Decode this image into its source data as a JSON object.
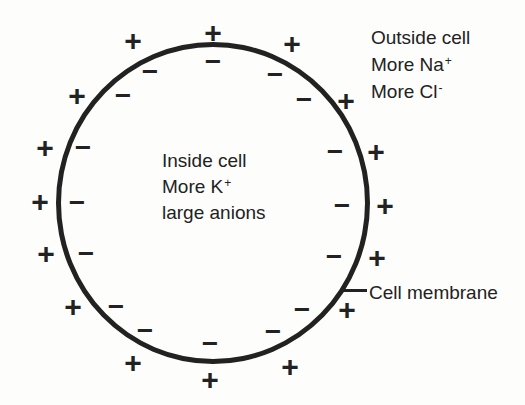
{
  "canvas": {
    "width": 525,
    "height": 405,
    "background": "#fdfdfc",
    "ink": "#222222"
  },
  "labels": {
    "outside": {
      "line1": "Outside cell",
      "line2_base": "More Na",
      "line2_sup": "+",
      "line3_base": "More Cl",
      "line3_sup": "-"
    },
    "inside": {
      "line1": "Inside cell",
      "line2_base": "More K",
      "line2_sup": "+",
      "line3": "large anions"
    },
    "membrane": "Cell membrane"
  },
  "charges": {
    "plus_glyph": "+",
    "minus_glyph": "−",
    "outside_plus_positions": [
      [
        213,
        33
      ],
      [
        292,
        44
      ],
      [
        346,
        101
      ],
      [
        376,
        152
      ],
      [
        385,
        206
      ],
      [
        377,
        258
      ],
      [
        347,
        310
      ],
      [
        290,
        367
      ],
      [
        210,
        380
      ],
      [
        133,
        363
      ],
      [
        73,
        307
      ],
      [
        46,
        254
      ],
      [
        40,
        202
      ],
      [
        45,
        148
      ],
      [
        77,
        96
      ],
      [
        133,
        41
      ]
    ],
    "inside_minus_positions": [
      [
        213,
        62
      ],
      [
        275,
        75
      ],
      [
        304,
        100
      ],
      [
        335,
        152
      ],
      [
        342,
        206
      ],
      [
        334,
        257
      ],
      [
        302,
        310
      ],
      [
        273,
        332
      ],
      [
        210,
        344
      ],
      [
        145,
        331
      ],
      [
        116,
        307
      ],
      [
        86,
        254
      ],
      [
        77,
        203
      ],
      [
        83,
        148
      ],
      [
        123,
        96
      ],
      [
        150,
        72
      ]
    ]
  }
}
